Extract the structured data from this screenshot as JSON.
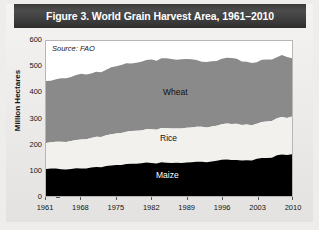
{
  "figure": {
    "title": "Figure 3. World Grain Harvest Area, 1961–2010",
    "source_note": "Source: FAO",
    "ylabel": "Million Hectares"
  },
  "labels": {
    "wheat": "Wheat",
    "rice": "Rice",
    "maize": "Maize"
  },
  "colors": {
    "wheat": "#8a8a8a",
    "rice": "#f2f1ee",
    "maize": "#000000",
    "title_bar": "#3d3d3d",
    "panel_bg": "#ecebe9",
    "plot_bg": "#ffffff",
    "axis": "#5a5a5a"
  },
  "axes": {
    "y_ticks": [
      0,
      100,
      200,
      300,
      400,
      500,
      600
    ],
    "y_tick_labels": [
      "0",
      "100",
      "200",
      "300",
      "400",
      "500",
      "600"
    ],
    "ylim": [
      0,
      600
    ],
    "x_ticks": [
      1961,
      1968,
      1975,
      1982,
      1989,
      1996,
      2003,
      2010
    ],
    "x_tick_labels": [
      "1961",
      "1968",
      "1975",
      "1982",
      "1989",
      "1996",
      "2003",
      "2010"
    ],
    "xlim": [
      1961,
      2010
    ],
    "grid": false
  },
  "chart_data": {
    "type": "area",
    "stacked": true,
    "title": "Figure 3. World Grain Harvest Area, 1961–2010",
    "xlabel": "",
    "ylabel": "Million Hectares",
    "xlim": [
      1961,
      2010
    ],
    "ylim": [
      0,
      600
    ],
    "grid": false,
    "legend": "inline-labels",
    "source": "Source: FAO",
    "units": "million hectares",
    "x": [
      1961,
      1962,
      1963,
      1964,
      1965,
      1966,
      1967,
      1968,
      1969,
      1970,
      1971,
      1972,
      1973,
      1974,
      1975,
      1976,
      1977,
      1978,
      1979,
      1980,
      1981,
      1982,
      1983,
      1984,
      1985,
      1986,
      1987,
      1988,
      1989,
      1990,
      1991,
      1992,
      1993,
      1994,
      1995,
      1996,
      1997,
      1998,
      1999,
      2000,
      2001,
      2002,
      2003,
      2004,
      2005,
      2006,
      2007,
      2008,
      2009,
      2010
    ],
    "series": [
      {
        "name": "Maize",
        "color": "#000000",
        "values": [
          105,
          106,
          106,
          104,
          103,
          105,
          107,
          106,
          106,
          110,
          112,
          111,
          116,
          118,
          120,
          120,
          124,
          125,
          125,
          127,
          130,
          128,
          126,
          131,
          129,
          128,
          129,
          128,
          130,
          131,
          133,
          133,
          131,
          134,
          136,
          140,
          141,
          139,
          139,
          137,
          138,
          137,
          144,
          147,
          147,
          148,
          158,
          161,
          159,
          162
        ]
      },
      {
        "name": "Rice",
        "color": "#f2f1ee",
        "values": [
          100,
          102,
          104,
          106,
          106,
          108,
          110,
          113,
          114,
          115,
          117,
          117,
          119,
          121,
          122,
          124,
          125,
          127,
          128,
          127,
          128,
          130,
          130,
          132,
          133,
          133,
          132,
          133,
          134,
          134,
          135,
          135,
          134,
          135,
          136,
          138,
          140,
          140,
          141,
          138,
          139,
          137,
          136,
          139,
          141,
          142,
          143,
          145,
          143,
          146
        ]
      },
      {
        "name": "Wheat",
        "color": "#8a8a8a",
        "values": [
          240,
          238,
          242,
          246,
          247,
          248,
          251,
          254,
          250,
          249,
          252,
          251,
          254,
          259,
          260,
          263,
          265,
          261,
          263,
          266,
          268,
          270,
          268,
          270,
          271,
          269,
          266,
          268,
          266,
          264,
          258,
          252,
          254,
          253,
          251,
          253,
          254,
          255,
          251,
          246,
          243,
          241,
          238,
          241,
          240,
          238,
          236,
          240,
          236,
          225
        ]
      }
    ],
    "stack_tops": {
      "maize_top": [
        105,
        106,
        106,
        104,
        103,
        105,
        107,
        106,
        106,
        110,
        112,
        111,
        116,
        118,
        120,
        120,
        124,
        125,
        125,
        127,
        130,
        128,
        126,
        131,
        129,
        128,
        129,
        128,
        130,
        131,
        133,
        133,
        131,
        134,
        136,
        140,
        141,
        139,
        139,
        137,
        138,
        137,
        144,
        147,
        147,
        148,
        158,
        161,
        159,
        162
      ],
      "rice_top": [
        205,
        208,
        210,
        210,
        209,
        213,
        217,
        219,
        220,
        225,
        229,
        228,
        235,
        239,
        242,
        244,
        249,
        252,
        253,
        254,
        258,
        258,
        256,
        263,
        262,
        261,
        261,
        261,
        264,
        265,
        268,
        268,
        265,
        269,
        272,
        278,
        281,
        279,
        280,
        275,
        277,
        274,
        280,
        286,
        288,
        290,
        301,
        306,
        302,
        308
      ],
      "total": [
        445,
        446,
        452,
        456,
        456,
        461,
        468,
        473,
        470,
        474,
        481,
        479,
        489,
        498,
        502,
        507,
        514,
        513,
        516,
        520,
        526,
        528,
        524,
        533,
        533,
        530,
        527,
        529,
        530,
        529,
        526,
        520,
        519,
        522,
        523,
        531,
        535,
        534,
        531,
        521,
        520,
        515,
        518,
        527,
        528,
        528,
        537,
        546,
        538,
        533
      ]
    }
  }
}
